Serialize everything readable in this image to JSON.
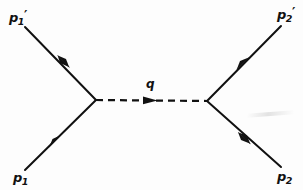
{
  "diagram": {
    "type": "feynman-diagram",
    "background_color": "#fdfdfd",
    "line_color": "#111111",
    "vertices": {
      "left": {
        "x": 96,
        "y": 100
      },
      "right": {
        "x": 207,
        "y": 101
      }
    },
    "labels": {
      "p1_prime": {
        "base": "p",
        "sub": "1",
        "prime": "′",
        "position": "top-left"
      },
      "p1": {
        "base": "p",
        "sub": "1",
        "prime": "",
        "position": "bottom-left"
      },
      "p2_prime": {
        "base": "p",
        "sub": "2",
        "prime": "′",
        "position": "top-right"
      },
      "p2": {
        "base": "p",
        "sub": "2",
        "prime": "",
        "position": "bottom-right"
      },
      "q": {
        "base": "q",
        "position": "above-propagator"
      }
    },
    "legs": [
      {
        "name": "incoming-p1",
        "from": {
          "x": 25,
          "y": 170
        },
        "to": {
          "x": 96,
          "y": 100
        },
        "arrow_direction": "toward-vertex",
        "style": "solid"
      },
      {
        "name": "outgoing-p1-prime",
        "from": {
          "x": 96,
          "y": 100
        },
        "to": {
          "x": 25,
          "y": 27
        },
        "arrow_direction": "away-from-vertex",
        "style": "solid"
      },
      {
        "name": "incoming-p2",
        "from": {
          "x": 281,
          "y": 167
        },
        "to": {
          "x": 207,
          "y": 101
        },
        "arrow_direction": "toward-vertex",
        "style": "solid"
      },
      {
        "name": "outgoing-p2-prime",
        "from": {
          "x": 207,
          "y": 101
        },
        "to": {
          "x": 281,
          "y": 26
        },
        "arrow_direction": "away-from-vertex",
        "style": "solid"
      }
    ],
    "propagator": {
      "name": "exchanged-boson",
      "from": {
        "x": 96,
        "y": 100
      },
      "to": {
        "x": 207,
        "y": 101
      },
      "style": "dashed",
      "arrow_direction": "left-to-right",
      "label": "q"
    }
  }
}
